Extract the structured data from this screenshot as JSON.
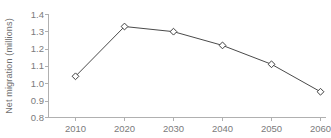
{
  "chart_data": {
    "type": "line",
    "title": "",
    "subtitle": "",
    "xlabel": "",
    "ylabel": "Net migration (millions)",
    "categories": [
      "2010",
      "2020",
      "2030",
      "2040",
      "2050",
      "2060"
    ],
    "x": [
      2010,
      2020,
      2030,
      2040,
      2050,
      2060
    ],
    "values": [
      1.04,
      1.33,
      1.3,
      1.22,
      1.11,
      0.95
    ],
    "series": [
      {
        "name": "Net migration",
        "values": [
          1.04,
          1.33,
          1.3,
          1.22,
          1.11,
          0.95
        ]
      }
    ],
    "ylim": [
      0.8,
      1.4
    ],
    "xlim": [
      2010,
      2060
    ],
    "ytick_labels": [
      "1.4",
      "1.3",
      "1.2",
      "1.1",
      "1.0",
      "0.9",
      "0.8"
    ],
    "ytick_values": [
      1.4,
      1.3,
      1.2,
      1.1,
      1.0,
      0.9,
      0.8
    ],
    "xtick_labels": [
      "2010",
      "2020",
      "2030",
      "2040",
      "2050",
      "2060"
    ],
    "grid": false,
    "legend": false,
    "legend_position": "none",
    "marker": "diamond-open",
    "colors": {
      "line": "#4a4a4a",
      "marker_fill": "#ffffff",
      "marker_stroke": "#3f3f3f",
      "axis": "#b0b0b0",
      "text": "#7b7b7b",
      "background": "#ffffff"
    }
  }
}
